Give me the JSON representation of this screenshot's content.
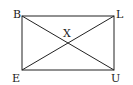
{
  "diagram": {
    "shape": "rectangle",
    "vertices": [
      {
        "name": "B",
        "x": 22,
        "y": 16,
        "label_x": 13,
        "label_y": 18
      },
      {
        "name": "L",
        "x": 114,
        "y": 16,
        "label_x": 116,
        "label_y": 18
      },
      {
        "name": "U",
        "x": 114,
        "y": 70,
        "label_x": 111,
        "label_y": 82
      },
      {
        "name": "E",
        "x": 22,
        "y": 70,
        "label_x": 12,
        "label_y": 82
      }
    ],
    "intersection": {
      "name": "X",
      "x": 68,
      "y": 43,
      "label_x": 63,
      "label_y": 37
    },
    "diagonals": [
      "BU",
      "EL"
    ],
    "stroke_color": "#222222"
  }
}
